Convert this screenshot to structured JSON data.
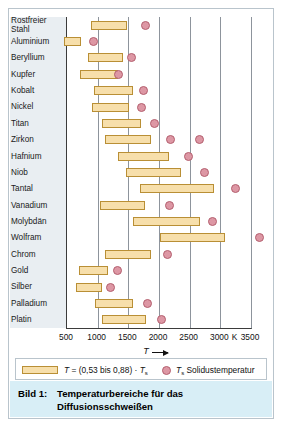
{
  "figure": {
    "caption_label": "Bild 1:",
    "caption_text": "Temperaturbereiche für das Diffusionsschweißen"
  },
  "legend": {
    "range_text": "T = (0,53 bis 0,88) · Ts",
    "range_text_plain": "T = (0,53 bis 0,88) · T_s",
    "solidus_text": "Ts Solidustemperatur",
    "solidus_text_plain": "T_s Solidustemperatur",
    "bar_color": "#f7dfab",
    "bar_border_color": "#b98f35",
    "dot_color": "#dd97a4",
    "dot_border_color": "#b4606f"
  },
  "axis": {
    "title": "T",
    "unit": "K",
    "ticks": [
      500,
      1000,
      1500,
      2000,
      2500,
      3000,
      3500
    ],
    "tick_labels": [
      "500",
      "1000",
      "1500",
      "2000",
      "2500",
      "3000",
      "3500"
    ],
    "min": 500,
    "max": 3500
  },
  "chart_data": {
    "type": "bar",
    "orientation": "horizontal-range",
    "title": "Temperaturbereiche für das Diffusionsschweißen",
    "xlabel": "T",
    "ylabel": "",
    "unit": "K",
    "xlim": [
      500,
      3500
    ],
    "grid": true,
    "legend_position": "below",
    "series": [
      {
        "name": "T = (0,53 bis 0,88) · Ts",
        "type": "range-bar"
      },
      {
        "name": "Ts Solidustemperatur",
        "type": "marker"
      }
    ],
    "categories": [
      "Rostfreier Stahl",
      "Aluminium",
      "Beryllium",
      "Kupfer",
      "Kobalt",
      "Nickel",
      "Titan",
      "Zirkon",
      "Hafnium",
      "Niob",
      "Tantal",
      "Vanadium",
      "Molybdän",
      "Wolfram",
      "Chrom",
      "Gold",
      "Silber",
      "Palladium",
      "Platin"
    ],
    "rows": [
      {
        "label": "Rostfreier Stahl",
        "label_lines": [
          "Rostfreier",
          "Stahl"
        ],
        "range": [
          900,
          1500
        ],
        "solidus": [
          1800
        ]
      },
      {
        "label": "Aluminium",
        "label_lines": [
          "Aluminium"
        ],
        "range": [
          470,
          750
        ],
        "solidus": [
          950
        ]
      },
      {
        "label": "Beryllium",
        "label_lines": [
          "Beryllium"
        ],
        "range": [
          860,
          1430
        ],
        "solidus": [
          1560
        ]
      },
      {
        "label": "Kupfer",
        "label_lines": [
          "Kupfer"
        ],
        "range": [
          730,
          1340
        ],
        "solidus": [
          1360
        ]
      },
      {
        "label": "Kobalt",
        "label_lines": [
          "Kobalt"
        ],
        "range": [
          950,
          1590
        ],
        "solidus": [
          1770
        ]
      },
      {
        "label": "Nickel",
        "label_lines": [
          "Nickel"
        ],
        "range": [
          930,
          1520
        ],
        "solidus": [
          1730
        ]
      },
      {
        "label": "Titan",
        "label_lines": [
          "Titan"
        ],
        "range": [
          1080,
          1720
        ],
        "solidus": [
          1950
        ]
      },
      {
        "label": "Zirkon",
        "label_lines": [
          "Zirkon"
        ],
        "range": [
          1140,
          1880
        ],
        "solidus": [
          2210,
          2670
        ]
      },
      {
        "label": "Hafnium",
        "label_lines": [
          "Hafnium"
        ],
        "range": [
          1350,
          2180
        ],
        "solidus": [
          2500
        ]
      },
      {
        "label": "Niob",
        "label_lines": [
          "Niob"
        ],
        "range": [
          1480,
          2380
        ],
        "solidus": [
          2760
        ]
      },
      {
        "label": "Tantal",
        "label_lines": [
          "Tantal"
        ],
        "range": [
          1700,
          2920
        ],
        "solidus": [
          3270
        ]
      },
      {
        "label": "Vanadium",
        "label_lines": [
          "Vanadium"
        ],
        "range": [
          1060,
          1790
        ],
        "solidus": [
          2180
        ]
      },
      {
        "label": "Molybdän",
        "label_lines": [
          "Molybdän"
        ],
        "range": [
          1590,
          2680
        ],
        "solidus": [
          2890
        ]
      },
      {
        "label": "Wolfram",
        "label_lines": [
          "Wolfram"
        ],
        "range": [
          2030,
          3100
        ],
        "solidus": [
          3650
        ]
      },
      {
        "label": "Chrom",
        "label_lines": [
          "Chrom"
        ],
        "range": [
          1130,
          1880
        ],
        "solidus": [
          2150
        ]
      },
      {
        "label": "Gold",
        "label_lines": [
          "Gold"
        ],
        "range": [
          710,
          1180
        ],
        "solidus": [
          1340
        ]
      },
      {
        "label": "Silber",
        "label_lines": [
          "Silber"
        ],
        "range": [
          660,
          1090
        ],
        "solidus": [
          1230
        ]
      },
      {
        "label": "Palladium",
        "label_lines": [
          "Palladium"
        ],
        "range": [
          970,
          1600
        ],
        "solidus": [
          1830
        ]
      },
      {
        "label": "Platin",
        "label_lines": [
          "Platin"
        ],
        "range": [
          1080,
          1800
        ],
        "solidus": [
          2050
        ]
      }
    ]
  }
}
